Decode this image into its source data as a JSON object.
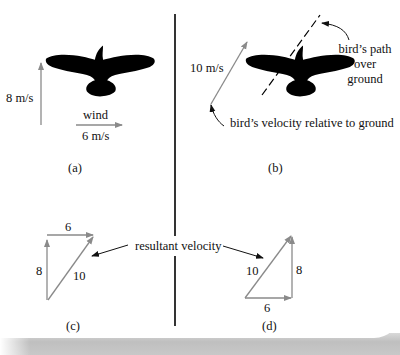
{
  "figure": {
    "panels": {
      "a": {
        "caption": "(a)",
        "vertical_label": "8 m/s",
        "wind_label": "wind",
        "wind_speed_label": "6 m/s"
      },
      "b": {
        "caption": "(b)",
        "velocity_label": "10 m/s",
        "path_label_line1": "bird’s path",
        "path_label_line2": "over",
        "path_label_line3": "ground",
        "velocity_annotation": "bird’s velocity relative to ground"
      },
      "c": {
        "caption": "(c)",
        "top_label": "6",
        "left_label": "8",
        "hyp_label": "10"
      },
      "d": {
        "caption": "(d)",
        "bottom_label": "6",
        "right_label": "8",
        "hyp_label": "10"
      }
    },
    "shared_label": "resultant velocity",
    "colors": {
      "vector": "#8a8a8a",
      "silhouette": "#000000",
      "text": "#111111",
      "divider": "#000000"
    }
  }
}
